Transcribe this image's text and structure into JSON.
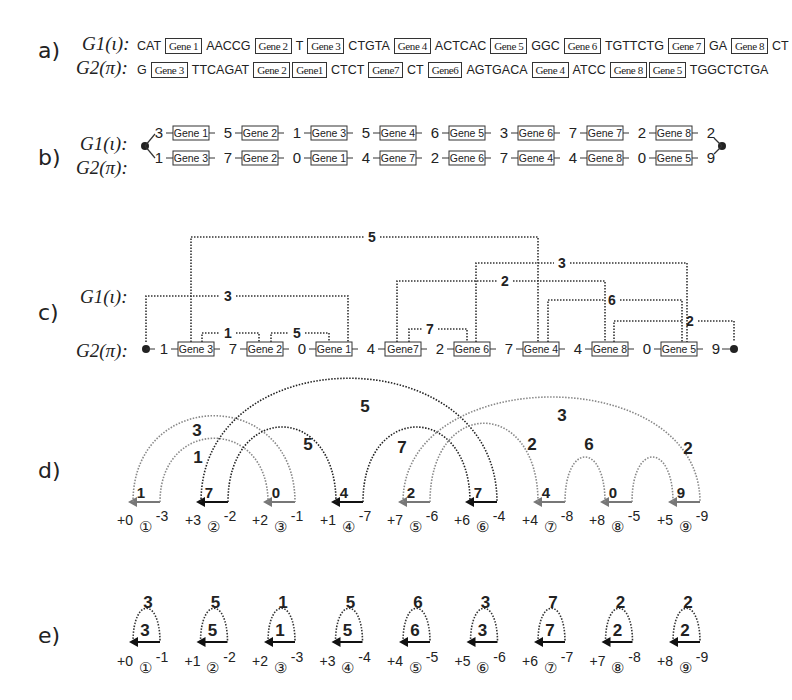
{
  "panels": {
    "a": {
      "label": "a)",
      "g1_label": "G1(ι):",
      "g2_label": "G2(π):",
      "g1_sequence": [
        {
          "t": "txt",
          "v": "CAT"
        },
        {
          "t": "gene",
          "v": "Gene 1"
        },
        {
          "t": "txt",
          "v": "AACCG"
        },
        {
          "t": "gene",
          "v": "Gene 2"
        },
        {
          "t": "txt",
          "v": "T"
        },
        {
          "t": "gene",
          "v": "Gene 3"
        },
        {
          "t": "txt",
          "v": "CTGTA"
        },
        {
          "t": "gene",
          "v": "Gene 4"
        },
        {
          "t": "txt",
          "v": "ACTCAC"
        },
        {
          "t": "gene",
          "v": "Gene 5"
        },
        {
          "t": "txt",
          "v": "GGC"
        },
        {
          "t": "gene",
          "v": "Gene 6"
        },
        {
          "t": "txt",
          "v": "TGTTCTG"
        },
        {
          "t": "gene",
          "v": "Gene 7"
        },
        {
          "t": "txt",
          "v": "GA"
        },
        {
          "t": "gene",
          "v": "Gene 8"
        },
        {
          "t": "txt",
          "v": "CT"
        }
      ],
      "g2_sequence": [
        {
          "t": "txt",
          "v": "G"
        },
        {
          "t": "gene",
          "v": "Gene 3"
        },
        {
          "t": "txt",
          "v": "TTCAGAT"
        },
        {
          "t": "gene",
          "v": "Gene 2"
        },
        {
          "t": "gene",
          "v": "Gene1"
        },
        {
          "t": "txt",
          "v": "CTCT"
        },
        {
          "t": "gene",
          "v": "Gene7"
        },
        {
          "t": "txt",
          "v": "CT"
        },
        {
          "t": "gene",
          "v": "Gene6"
        },
        {
          "t": "txt",
          "v": "AGTGACA"
        },
        {
          "t": "gene",
          "v": "Gene 4"
        },
        {
          "t": "txt",
          "v": "ATCC"
        },
        {
          "t": "gene",
          "v": "Gene 8"
        },
        {
          "t": "gene",
          "v": "Gene 5"
        },
        {
          "t": "txt",
          "v": "TGGCTCTGA"
        }
      ]
    },
    "b": {
      "label": "b)",
      "g1_label": "G1(ι):",
      "g2_label": "G2(π):",
      "g1_intergenes": [
        "3",
        "5",
        "1",
        "5",
        "6",
        "3",
        "7",
        "2",
        "2"
      ],
      "g1_genes": [
        "Gene 1",
        "Gene 2",
        "Gene 3",
        "Gene 4",
        "Gene 5",
        "Gene 6",
        "Gene 7",
        "Gene 8"
      ],
      "g2_intergenes": [
        "1",
        "7",
        "0",
        "4",
        "2",
        "7",
        "4",
        "0",
        "9"
      ],
      "g2_genes": [
        "Gene 3",
        "Gene 2",
        "Gene 1",
        "Gene 7",
        "Gene 6",
        "Gene 4",
        "Gene 8",
        "Gene 5"
      ]
    },
    "c": {
      "label": "c)",
      "g1_label": "G1(ι):",
      "g2_label": "G2(π):",
      "intergenes": [
        "1",
        "7",
        "0",
        "4",
        "2",
        "7",
        "4",
        "0",
        "9"
      ],
      "genes": [
        "Gene 3",
        "Gene 2",
        "Gene 1",
        "Gene7",
        "Gene 6",
        "Gene 4",
        "Gene 8",
        "Gene 5"
      ],
      "links": [
        "5",
        "3",
        "1",
        "5",
        "3",
        "2",
        "7",
        "6",
        "2"
      ]
    },
    "d": {
      "label": "d)",
      "nodes": [
        {
          "id": "①",
          "left": "+0",
          "right": "-3",
          "inner": "1"
        },
        {
          "id": "②",
          "left": "+3",
          "right": "-2",
          "inner": "7"
        },
        {
          "id": "③",
          "left": "+2",
          "right": "-1",
          "inner": "0"
        },
        {
          "id": "④",
          "left": "+1",
          "right": "-7",
          "inner": "4"
        },
        {
          "id": "⑤",
          "left": "+7",
          "right": "-6",
          "inner": "2"
        },
        {
          "id": "⑥",
          "left": "+6",
          "right": "-4",
          "inner": "7"
        },
        {
          "id": "⑦",
          "left": "+4",
          "right": "-8",
          "inner": "4"
        },
        {
          "id": "⑧",
          "left": "+8",
          "right": "-5",
          "inner": "0"
        },
        {
          "id": "⑨",
          "left": "+5",
          "right": "-9",
          "inner": "9"
        }
      ],
      "arc_labels": [
        "3",
        "1",
        "5",
        "5",
        "7",
        "2",
        "3",
        "6",
        "2"
      ]
    },
    "e": {
      "label": "e)",
      "nodes": [
        {
          "id": "①",
          "left": "+0",
          "right": "-1",
          "top": "3",
          "inner": "3"
        },
        {
          "id": "②",
          "left": "+1",
          "right": "-2",
          "top": "5",
          "inner": "5"
        },
        {
          "id": "③",
          "left": "+2",
          "right": "-3",
          "top": "1",
          "inner": "1"
        },
        {
          "id": "④",
          "left": "+3",
          "right": "-4",
          "top": "5",
          "inner": "5"
        },
        {
          "id": "⑤",
          "left": "+4",
          "right": "-5",
          "top": "6",
          "inner": "6"
        },
        {
          "id": "⑥",
          "left": "+5",
          "right": "-6",
          "top": "3",
          "inner": "3"
        },
        {
          "id": "⑦",
          "left": "+6",
          "right": "-7",
          "top": "7",
          "inner": "7"
        },
        {
          "id": "⑧",
          "left": "+7",
          "right": "-8",
          "top": "2",
          "inner": "2"
        },
        {
          "id": "⑨",
          "left": "+8",
          "right": "-9",
          "top": "2",
          "inner": "2"
        }
      ]
    }
  }
}
